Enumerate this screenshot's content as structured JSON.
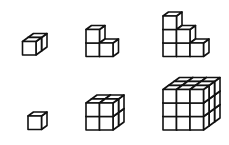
{
  "diagram": {
    "line_color": "#111111",
    "fill_color": "#ffffff",
    "background": "#ffffff",
    "cube_size": 13.5,
    "depth_dx": 5.5,
    "depth_dy": -4,
    "figures": [
      {
        "id": "top-left",
        "label": "1-wide, 1-tall, 2-deep stack",
        "origin": [
          22.5,
          55
        ],
        "heights": [
          [
            1,
            1
          ]
        ]
      },
      {
        "id": "top-middle",
        "label": "L-shaped staircase of 3 cubes",
        "origin": [
          86,
          56.5
        ],
        "heights": [
          [
            2
          ],
          [
            1
          ]
        ]
      },
      {
        "id": "top-right",
        "label": "Staircase of 6 cubes (3-2-1)",
        "origin": [
          163,
          56.5
        ],
        "heights": [
          [
            3
          ],
          [
            2
          ],
          [
            1
          ]
        ]
      },
      {
        "id": "bottom-left",
        "label": "Single cube 1x1x1",
        "origin": [
          28,
          129.5
        ],
        "heights": [
          [
            1
          ]
        ]
      },
      {
        "id": "bottom-middle",
        "label": "Cube 2x2x2",
        "origin": [
          86,
          130
        ],
        "heights": [
          [
            2,
            2
          ],
          [
            2,
            2
          ]
        ]
      },
      {
        "id": "bottom-right",
        "label": "Cube 3x3x3",
        "origin": [
          163,
          130
        ],
        "heights": [
          [
            3,
            3,
            3
          ],
          [
            3,
            3,
            3
          ],
          [
            3,
            3,
            3
          ]
        ]
      }
    ]
  }
}
